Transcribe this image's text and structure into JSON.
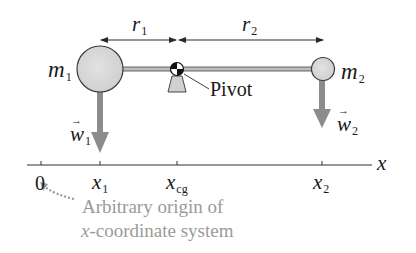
{
  "diagram": {
    "labels": {
      "r1": "r",
      "r1_sub": "1",
      "r2": "r",
      "r2_sub": "2",
      "m1": "m",
      "m1_sub": "1",
      "m2": "m",
      "m2_sub": "2",
      "pivot": "Pivot",
      "w1": "w",
      "w1_sub": "1",
      "w2": "w",
      "w2_sub": "2",
      "axis_name": "x"
    },
    "axis_ticks": [
      {
        "label": "0",
        "sub": ""
      },
      {
        "label": "x",
        "sub": "1"
      },
      {
        "label": "x",
        "sub": "cg"
      },
      {
        "label": "x",
        "sub": "2"
      }
    ],
    "annotation": {
      "line1": "Arbitrary origin of",
      "line2_italic": "x",
      "line2_rest": "-coordinate system"
    },
    "colors": {
      "mass_fill": "#d4d4d4",
      "mass_stroke": "#3a3a3a",
      "weight_arrow": "#8c8c8c",
      "annotation_text": "#9a9a9a",
      "line": "#2a2a2a"
    }
  }
}
